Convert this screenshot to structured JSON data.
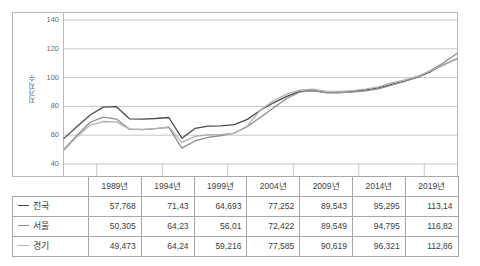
{
  "chart_data": {
    "type": "line",
    "title": "",
    "xlabel": "",
    "ylabel": "지가지수",
    "ylim": [
      40,
      140
    ],
    "yticks": [
      40,
      60,
      80,
      100,
      120,
      140
    ],
    "grid": true,
    "legend_position": "table-left",
    "categories": [
      "1989년",
      "1994년",
      "1999년",
      "2004년",
      "2009년",
      "2014년",
      "2019년"
    ],
    "x": [
      1989,
      1994,
      1999,
      2004,
      2009,
      2014,
      2019
    ],
    "series": [
      {
        "name": "전국",
        "color": "#4a4a4a",
        "values": [
          57.768,
          71.43,
          64.693,
          77.252,
          89.543,
          95.295,
          113.14
        ],
        "yearly_x": [
          1989,
          1990,
          1991,
          1992,
          1993,
          1994,
          1995,
          1996,
          1997,
          1998,
          1999,
          2000,
          2001,
          2002,
          2003,
          2004,
          2005,
          2006,
          2007,
          2008,
          2009,
          2010,
          2011,
          2012,
          2013,
          2014,
          2015,
          2016,
          2017,
          2018,
          2019
        ],
        "yearly_values": [
          57.8,
          66.0,
          74.0,
          79.5,
          79.8,
          71.4,
          71.2,
          71.6,
          72.3,
          57.9,
          64.7,
          66.3,
          66.5,
          67.4,
          71.0,
          77.3,
          82.5,
          87.0,
          90.4,
          91.0,
          89.5,
          89.6,
          90.4,
          91.4,
          92.9,
          95.3,
          97.6,
          100.3,
          104.2,
          109.0,
          113.1
        ]
      },
      {
        "name": "서울",
        "color": "#8d8d8d",
        "values": [
          50.305,
          64.23,
          56.01,
          72.422,
          89.549,
          94.795,
          116.82
        ],
        "yearly_x": [
          1989,
          1990,
          1991,
          1992,
          1993,
          1994,
          1995,
          1996,
          1997,
          1998,
          1999,
          2000,
          2001,
          2002,
          2003,
          2004,
          2005,
          2006,
          2007,
          2008,
          2009,
          2010,
          2011,
          2012,
          2013,
          2014,
          2015,
          2016,
          2017,
          2018,
          2019
        ],
        "yearly_values": [
          50.3,
          60.0,
          69.0,
          72.5,
          71.2,
          64.2,
          63.9,
          64.5,
          65.5,
          51.0,
          56.0,
          58.5,
          59.8,
          61.5,
          66.0,
          72.4,
          79.0,
          85.5,
          90.0,
          91.2,
          89.5,
          89.5,
          90.0,
          90.8,
          92.2,
          94.8,
          97.3,
          100.4,
          105.0,
          110.5,
          116.8
        ]
      },
      {
        "name": "경기",
        "color": "#b2b2b2",
        "values": [
          49.473,
          64.24,
          59.216,
          77.585,
          90.619,
          96.321,
          112.86
        ],
        "yearly_x": [
          1989,
          1990,
          1991,
          1992,
          1993,
          1994,
          1995,
          1996,
          1997,
          1998,
          1999,
          2000,
          2001,
          2002,
          2003,
          2004,
          2005,
          2006,
          2007,
          2008,
          2009,
          2010,
          2011,
          2012,
          2013,
          2014,
          2015,
          2016,
          2017,
          2018,
          2019
        ],
        "yearly_values": [
          49.5,
          59.0,
          67.0,
          69.5,
          69.3,
          64.2,
          64.0,
          64.6,
          65.8,
          55.0,
          59.2,
          60.3,
          60.5,
          61.3,
          66.5,
          77.6,
          84.0,
          88.5,
          91.3,
          92.0,
          90.6,
          90.5,
          91.0,
          92.0,
          93.5,
          96.3,
          98.5,
          101.0,
          104.6,
          108.8,
          112.9
        ]
      }
    ]
  },
  "table": {
    "corner_label": "",
    "headers": [
      "1989년",
      "1994년",
      "1999년",
      "2004년",
      "2009년",
      "2014년",
      "2019년"
    ],
    "rows": [
      {
        "label": "전국",
        "marker": "line-marker-national",
        "values": [
          "57,768",
          "71,43",
          "64,693",
          "77,252",
          "89,543",
          "95,295",
          "113,14"
        ]
      },
      {
        "label": "서울",
        "marker": "line-marker-seoul",
        "values": [
          "50,305",
          "64,23",
          "56,01",
          "72,422",
          "89,549",
          "94,795",
          "116,82"
        ]
      },
      {
        "label": "경기",
        "marker": "line-marker-gyeonggi",
        "values": [
          "49,473",
          "64,24",
          "59,216",
          "77,585",
          "90,619",
          "96,321",
          "112,86"
        ]
      }
    ]
  },
  "colors": {
    "series_national": "#4a4a4a",
    "series_seoul": "#8d8d8d",
    "series_gyeonggi": "#b2b2b2",
    "grid": "#b9b9b9",
    "border": "#a8a8a8"
  }
}
